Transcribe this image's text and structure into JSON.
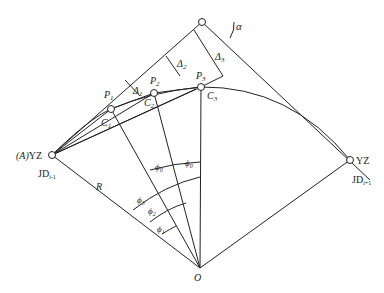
{
  "diagram": {
    "points": {
      "JD": {
        "x": 202,
        "y": 22
      },
      "A": {
        "x": 52,
        "y": 155
      },
      "YZ_right": {
        "x": 350,
        "y": 160
      },
      "O": {
        "x": 200,
        "y": 268
      },
      "P1": {
        "x": 111,
        "y": 109
      },
      "P2": {
        "x": 154,
        "y": 93
      },
      "P3": {
        "x": 201,
        "y": 87
      }
    },
    "labels": {
      "alpha": "α",
      "delta1": "Δ",
      "delta1_sub": "1",
      "delta2": "Δ",
      "delta2_sub": "2",
      "delta3": "Δ",
      "delta3_sub": "3",
      "p1": "P",
      "p1_sub": "1",
      "p2": "P",
      "p2_sub": "2",
      "p3": "P",
      "p3_sub": "3",
      "c1": "C",
      "c1_sub": "1",
      "c2": "C",
      "c2_sub": "2",
      "c3": "C",
      "c3_sub": "3",
      "left_yz_prefix": "(A)",
      "left_yz": "YZ",
      "right_yz": "YZ",
      "jd_left": "JD",
      "jd_left_sub": "i-1",
      "jd_right": "JD",
      "jd_right_sub": "i+1",
      "radius": "R",
      "center": "O",
      "phi0": "ϕ",
      "phi0_sub": "0",
      "phi0b": "ϕ",
      "phi0b_sub": "0",
      "phi1": "ϕ",
      "phi1_sub": "1",
      "phi2": "ϕ",
      "phi2_sub": "2",
      "phi3": "ϕ",
      "phi3_sub": "3"
    }
  }
}
